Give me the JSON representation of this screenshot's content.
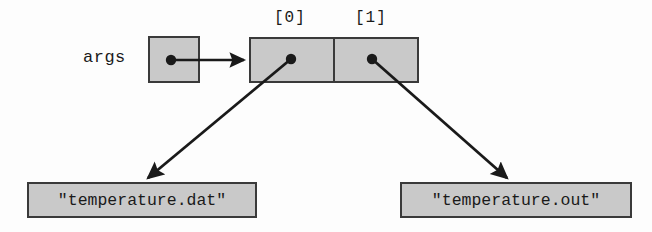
{
  "diagram": {
    "colors": {
      "box_fill": "#c9c9c9",
      "box_border": "#3a3a3a",
      "arrow": "#1a1a1a",
      "background": "#fdfdfd",
      "text": "#1a1a1a"
    },
    "variable": {
      "label": "args",
      "pointer_dot": true
    },
    "array": {
      "index_labels": [
        "[0]",
        "[1]"
      ],
      "cells": [
        {
          "index": "[0]",
          "pointer_dot": true
        },
        {
          "index": "[1]",
          "pointer_dot": true
        }
      ]
    },
    "strings": [
      {
        "value": "\"temperature.dat\""
      },
      {
        "value": "\"temperature.out\""
      }
    ],
    "arrows": [
      {
        "name": "args-to-array",
        "from": "args-box-dot",
        "to": "array-left-edge"
      },
      {
        "name": "cell0-to-string0",
        "from": "array-cell-0-dot",
        "to": "string-box-left"
      },
      {
        "name": "cell1-to-string1",
        "from": "array-cell-1-dot",
        "to": "string-box-right"
      }
    ]
  }
}
